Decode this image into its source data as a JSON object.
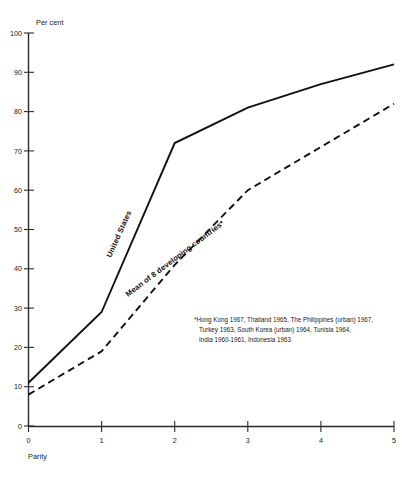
{
  "chart_data": {
    "type": "line",
    "title": "",
    "xlabel": "Parity",
    "ylabel": "Per cent",
    "x": [
      0,
      1,
      2,
      3,
      4,
      5
    ],
    "xlim": [
      0,
      5
    ],
    "ylim": [
      0,
      100
    ],
    "xticks": [
      "0",
      "1",
      "2",
      "3",
      "4",
      "5"
    ],
    "yticks": [
      "0",
      "10",
      "20",
      "30",
      "40",
      "50",
      "60",
      "70",
      "80",
      "90",
      "100"
    ],
    "grid": false,
    "legend_position": "inline-curve-labels",
    "series": [
      {
        "name": "United States",
        "style": "solid",
        "color": "#111111",
        "values": [
          11,
          29,
          72,
          81,
          87,
          92
        ]
      },
      {
        "name": "Mean of 8 developing countries*",
        "style": "dashed",
        "color": "#111111",
        "values": [
          8,
          19,
          41,
          60,
          71,
          82
        ]
      }
    ],
    "annotations": [
      "*Hong Kong 1967, Thailand 1965, The Philippines (urban) 1967,",
      "Turkey 1963, South Korea (urban) 1964, Tunisia 1964,",
      "India 1960-1961, Indonesia 1963"
    ]
  },
  "axis": {
    "y_title": "Per cent",
    "x_title": "Parity"
  },
  "labels": {
    "series_solid": "United States",
    "series_dashed": "Mean of 8 developing countries*"
  },
  "footnote": {
    "line1": "*Hong Kong 1967, Thailand 1965, The Philippines (urban) 1967,",
    "line2": "Turkey 1963, South Korea (urban) 1964, Tunisia 1964,",
    "line3": "India 1960-1961, Indonesia 1963"
  }
}
